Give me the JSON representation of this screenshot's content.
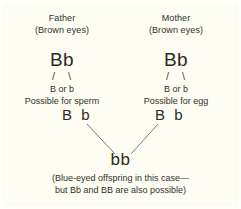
{
  "figure": {
    "type": "genetics-inheritance-diagram",
    "background_color": "#fdfdf3",
    "text_color": "#32322c",
    "line_color": "#6d6d63"
  },
  "father": {
    "title": "Father",
    "phenotype": "(Brown eyes)",
    "genotype": "Bb",
    "split_marks": "/ \\",
    "alleles": "B or b",
    "gamete_note": "Possible for sperm",
    "gametes": "B b"
  },
  "mother": {
    "title": "Mother",
    "phenotype": "(Brown eyes)",
    "genotype": "Bb",
    "split_marks": "/ \\",
    "alleles": "B or b",
    "gamete_note": "Possible for egg",
    "gametes": "B b"
  },
  "offspring": {
    "genotype": "bb",
    "caption_line1": "(Blue-eyed offspring in this case—",
    "caption_line2": "but Bb and BB are also possible)"
  }
}
